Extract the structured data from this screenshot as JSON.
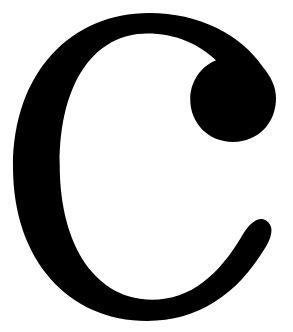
{
  "image": {
    "kind": "glyph-specimen",
    "character": "C",
    "character_name": "latin-capital-letter-c",
    "description": "Large black serif capital letter C on a plain white background",
    "typeface_style": "serif with ball terminal",
    "canvas": {
      "width": 293,
      "height": 332,
      "background_color": "#ffffff"
    },
    "glyph": {
      "fill_color": "#000000",
      "bounds": {
        "left": 13,
        "top": 13,
        "right": 276,
        "bottom": 321,
        "width": 263,
        "height": 308
      },
      "features": {
        "upper_terminal": "ball-terminal",
        "lower_terminal": "tapered-rounded-tip",
        "aperture": "open-right",
        "stroke_weight_max": 84,
        "stroke_weight_min": 36
      },
      "path": "M 276 92 C 276 119 257 139 231 139 C 205 139 186 119 186 93 C 186 74 197 58 213 51 C 195 33 170 22 141 22 C 86 22 49 74 49 163 C 49 254 89 309 146 309 C 186 309 216 283 241 239 C 250 224 259 219 266 224 C 273 229 273 238 266 251 C 235 305 193 332 141 332 C 58 332 0 266 0 166 C 0 64 61 0 143 0 C 195 0 239 23 262 58 C 271 69 276 80 276 92 Z"
    },
    "counter": {
      "description": "white inner space of the C",
      "color": "#ffffff"
    }
  }
}
